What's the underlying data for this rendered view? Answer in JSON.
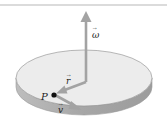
{
  "diagram": {
    "labels": {
      "omega": "ω",
      "r": "r",
      "v": "v",
      "point": "P"
    },
    "vector_accent": "→",
    "colors": {
      "background": "#ffffff",
      "rule": "#b8b8b8",
      "disc_top": "#ececec",
      "disc_side": "#a9a9a9",
      "disc_outline": "#9a9a9a",
      "arrow": "#a3a3a3",
      "point": "#111111",
      "label": "#222222"
    }
  }
}
